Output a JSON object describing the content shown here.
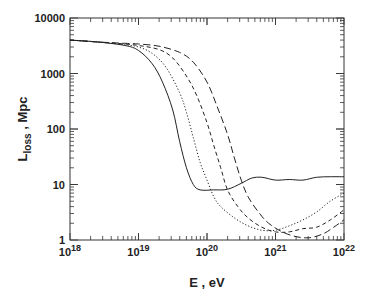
{
  "chart_data": {
    "type": "line",
    "title": "",
    "xlabel": "E , eV",
    "ylabel": "L_loss , Mpc",
    "ylabel_main": "L",
    "ylabel_sub": "loss",
    "ylabel_suffix": " , Mpc",
    "xscale": "log",
    "yscale": "log",
    "xlim": [
      1e+18,
      1e+22
    ],
    "ylim": [
      1,
      10000
    ],
    "grid": false,
    "legend": null,
    "x_ticks": [
      {
        "base": "10",
        "exp": "18",
        "value": 18
      },
      {
        "base": "10",
        "exp": "19",
        "value": 19
      },
      {
        "base": "10",
        "exp": "20",
        "value": 20
      },
      {
        "base": "10",
        "exp": "21",
        "value": 21
      },
      {
        "base": "10",
        "exp": "22",
        "value": 22
      }
    ],
    "y_ticks": [
      {
        "label": "1",
        "value": 0
      },
      {
        "label": "10",
        "value": 1
      },
      {
        "label": "100",
        "value": 2
      },
      {
        "label": "1000",
        "value": 3
      },
      {
        "label": "10000",
        "value": 4
      }
    ],
    "series": [
      {
        "name": "solid",
        "style": "solid",
        "log10_E": [
          18.0,
          18.4,
          18.8,
          19.0,
          19.2,
          19.35,
          19.5,
          19.6,
          19.7,
          19.8,
          19.9,
          20.1,
          20.3,
          20.5,
          20.65,
          20.8,
          21.0,
          21.2,
          21.4,
          21.6,
          21.8,
          22.0
        ],
        "L_Mpc": [
          4000,
          3700,
          3200,
          2600,
          1500,
          700,
          220,
          60,
          20,
          10,
          8,
          8,
          8.2,
          10.5,
          13,
          13.5,
          12,
          12.3,
          12,
          13.5,
          13.8,
          13.8
        ]
      },
      {
        "name": "dotted",
        "style": "dotted",
        "log10_E": [
          18.0,
          18.4,
          18.8,
          19.0,
          19.2,
          19.4,
          19.6,
          19.7,
          19.8,
          19.9,
          20.0,
          20.1,
          20.2,
          20.4,
          20.6,
          20.8,
          21.0,
          21.2,
          21.4,
          21.6,
          21.8,
          22.0
        ],
        "L_Mpc": [
          4000,
          3700,
          3300,
          3000,
          2300,
          1300,
          450,
          200,
          70,
          25,
          12,
          6,
          4,
          2.5,
          1.8,
          1.5,
          1.5,
          1.8,
          2.3,
          3.2,
          5,
          7
        ]
      },
      {
        "name": "short-dash",
        "style": "dashed-short",
        "log10_E": [
          18.0,
          18.4,
          18.8,
          19.0,
          19.3,
          19.5,
          19.7,
          19.85,
          20.0,
          20.1,
          20.2,
          20.3,
          20.45,
          20.6,
          20.8,
          21.0,
          21.2,
          21.4,
          21.6,
          21.8,
          22.0
        ],
        "L_Mpc": [
          4000,
          3700,
          3400,
          3200,
          2700,
          1900,
          900,
          400,
          130,
          50,
          20,
          8,
          4,
          2.5,
          1.7,
          1.4,
          1.4,
          1.6,
          1.7,
          2.3,
          3.5
        ]
      },
      {
        "name": "long-dash",
        "style": "dashed-long",
        "log10_E": [
          18.0,
          18.4,
          18.8,
          19.0,
          19.3,
          19.6,
          19.8,
          20.0,
          20.15,
          20.3,
          20.4,
          20.5,
          20.6,
          20.75,
          20.9,
          21.1,
          21.3,
          21.5,
          21.7,
          21.85,
          22.0
        ],
        "L_Mpc": [
          4000,
          3700,
          3500,
          3400,
          3100,
          2400,
          1600,
          700,
          250,
          80,
          30,
          12,
          6,
          3.2,
          2,
          1.4,
          1.15,
          1.1,
          1.3,
          1.7,
          2.3
        ]
      }
    ]
  }
}
